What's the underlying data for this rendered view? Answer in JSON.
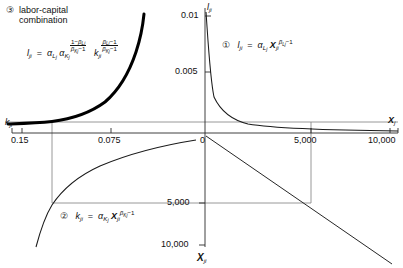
{
  "figure": {
    "type": "four-quadrant-diagram",
    "title": "labor-capital combination",
    "header": {
      "marker": "③",
      "line1": "labor-capital",
      "line2": "combination"
    },
    "axes": {
      "right_horizontal": {
        "label": "X",
        "label_sub": "j",
        "ticks": [
          "0",
          "5,000",
          "10,000"
        ],
        "tick_values": [
          0,
          5000,
          10000
        ]
      },
      "left_horizontal": {
        "label": "k",
        "label_sub": "ji",
        "ticks": [
          "0.15",
          "0.075"
        ],
        "tick_values": [
          0.15,
          0.075
        ]
      },
      "top_vertical": {
        "label": "l",
        "label_sub": "ji",
        "ticks": [
          "0.01",
          "0.005"
        ],
        "tick_values": [
          0.01,
          0.005
        ]
      },
      "bottom_vertical": {
        "label": "X",
        "label_sub": "ji",
        "ticks": [
          "5,000",
          "10,000"
        ],
        "tick_values": [
          5000,
          10000
        ]
      }
    },
    "relations": [
      {
        "marker": "①",
        "quadrant": "I",
        "lhs": "l",
        "lhs_sub": "ji",
        "eq": "=",
        "coef": "α",
        "coef_sub": "L",
        "coef_sub2": "j",
        "var": "X",
        "var_sub": "ji",
        "exp_main": "β",
        "exp_sub": "Lj",
        "exp_tail": "−1",
        "plain": "l_ji = α_Lj X_ji^(β_Lj − 1)"
      },
      {
        "marker": "②",
        "quadrant": "III",
        "lhs": "k",
        "lhs_sub": "ji",
        "eq": "=",
        "coef": "α",
        "coef_sub": "K",
        "coef_sub2": "j",
        "var": "X",
        "var_sub": "ji",
        "exp_main": "β",
        "exp_sub": "Kj",
        "exp_tail": "−1",
        "plain": "k_ji = α_Kj X_ji^(β_Kj − 1)"
      },
      {
        "marker": "③",
        "quadrant": "II",
        "lhs": "l",
        "lhs_sub": "ji",
        "eq": "=",
        "coef": "α",
        "coef_sub": "L",
        "coef_sub2": "j",
        "coef2": "α",
        "coef2_sub": "K",
        "coef2_sub2": "j",
        "frac1_num": "1−β",
        "frac1_num_sub": "Lj",
        "frac1_den": "β",
        "frac1_den_sub": "Kj",
        "frac1_den_tail": "−1",
        "var": "k",
        "var_sub": "ji",
        "frac2_num": "β",
        "frac2_num_sub": "Lj",
        "frac2_num_tail": "−1",
        "frac2_den": "β",
        "frac2_den_sub": "Kj",
        "frac2_den_tail": "−1",
        "plain": "l_ji = α_Lj α_Kj^((1−β_Lj)/(β_Kj−1)) k_ji^((β_Lj−1)/(β_Kj−1))"
      }
    ],
    "colors": {
      "curve_thin": "#1a1a1a",
      "curve_thick": "#000000",
      "guide": "#6e6e6e",
      "axis": "#3a3a3a",
      "background": "#ffffff"
    },
    "guides": {
      "note": "guide rectangle linking X_j = 5,000 through X_ji = 5,000, k_ji = 0.075 and up to curve ③"
    }
  }
}
